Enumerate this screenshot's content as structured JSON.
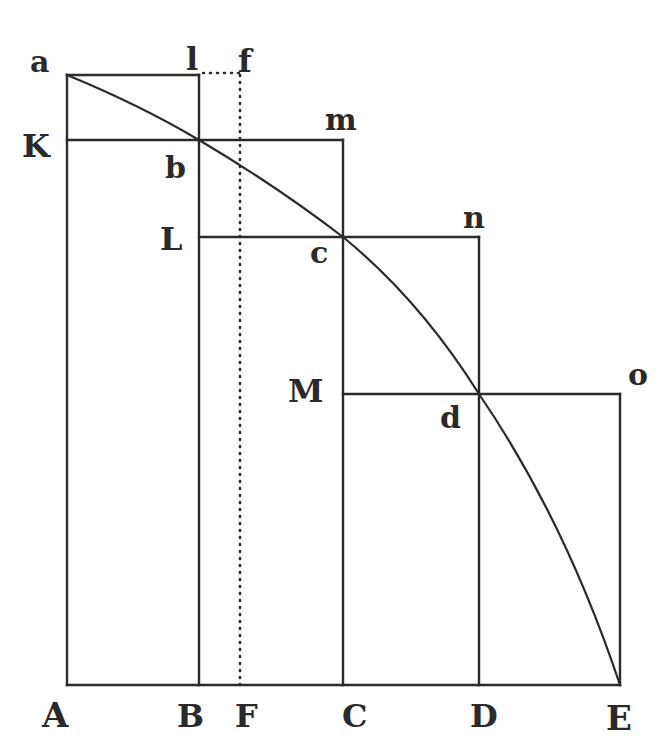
{
  "diagram": {
    "type": "geometric-figure",
    "colors": {
      "ink": "#2a2a2a",
      "background": "#ffffff"
    },
    "labels": {
      "a": "a",
      "l": "l",
      "f": "f",
      "K": "K",
      "b": "b",
      "m": "m",
      "L": "L",
      "c": "c",
      "n": "n",
      "M": "M",
      "d": "d",
      "o": "o",
      "A": "A",
      "B": "B",
      "F": "F",
      "C": "C",
      "D": "D",
      "E": "E"
    },
    "points": {
      "a": [
        67,
        75
      ],
      "l": [
        199,
        75
      ],
      "f": [
        240,
        75
      ],
      "K": [
        67,
        140
      ],
      "b": [
        199,
        140
      ],
      "m": [
        343,
        140
      ],
      "L": [
        199,
        237
      ],
      "c": [
        343,
        237
      ],
      "n": [
        479,
        237
      ],
      "M": [
        343,
        394
      ],
      "d": [
        479,
        394
      ],
      "o": [
        620,
        394
      ],
      "A": [
        67,
        685
      ],
      "B": [
        199,
        685
      ],
      "F": [
        240,
        685
      ],
      "C": [
        343,
        685
      ],
      "D": [
        479,
        685
      ],
      "E": [
        620,
        685
      ]
    }
  }
}
